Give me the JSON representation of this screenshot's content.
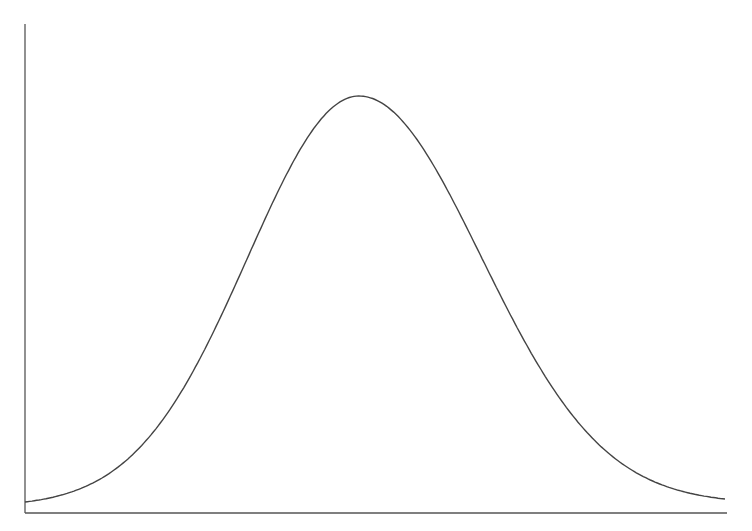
{
  "chart_data": {
    "type": "line",
    "title": "",
    "subtitle": "",
    "xlabel": "",
    "ylabel": "",
    "grid": false,
    "legend": null,
    "series": [
      {
        "name": "density",
        "x": [
          -3.0,
          -2.5,
          -2.0,
          -1.5,
          -1.0,
          -0.5,
          0.0,
          0.5,
          1.0,
          1.5,
          2.0,
          2.5,
          3.0
        ],
        "values": [
          0.004,
          0.018,
          0.054,
          0.13,
          0.242,
          0.352,
          0.399,
          0.352,
          0.242,
          0.13,
          0.054,
          0.018,
          0.004
        ]
      }
    ],
    "xlim": [
      -3.0,
      3.0
    ],
    "ylim": [
      0,
      0.42
    ]
  },
  "plot": {
    "origin_px": [
      25,
      513
    ],
    "x_axis_end_px": 727,
    "y_axis_top_px": 24,
    "peak_px": [
      359,
      96
    ],
    "curve_color": "#444444",
    "axis_color": "#555555"
  }
}
